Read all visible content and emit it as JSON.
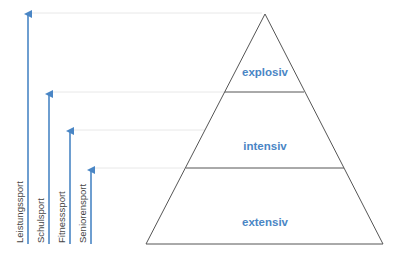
{
  "diagram": {
    "type": "pyramid-with-arrows",
    "colors": {
      "accent": "#4a86c5",
      "outline": "#555555",
      "guide": "#e6e6e6"
    },
    "levels": [
      {
        "label": "explosiv",
        "position": "top"
      },
      {
        "label": "intensiv",
        "position": "middle"
      },
      {
        "label": "extensiv",
        "position": "bottom"
      }
    ],
    "arrows": [
      {
        "label": "Leistungssport",
        "reaches": "explosiv"
      },
      {
        "label": "Schulsport",
        "reaches": "intensiv"
      },
      {
        "label": "Fitnesssport",
        "reaches": "intensiv"
      },
      {
        "label": "Seniorensport",
        "reaches": "extensiv"
      }
    ]
  }
}
